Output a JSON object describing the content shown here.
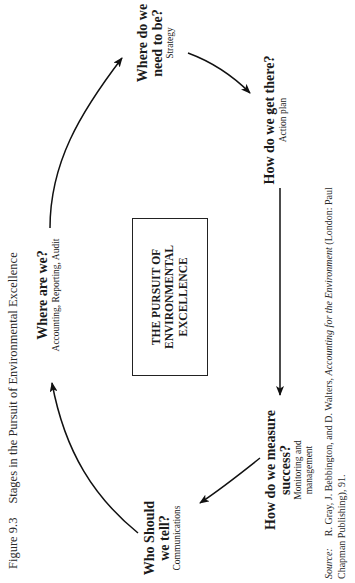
{
  "figure": {
    "number": "Figure 9.3",
    "title": "Stages in the Pursuit of Environmental Excellence"
  },
  "center": {
    "lines": [
      "THE PURSUIT OF",
      "ENVIRONMENTAL",
      "EXCELLENCE"
    ]
  },
  "nodes": [
    {
      "id": "where-are-we",
      "question": "Where are we?",
      "subtitle": "Accounting, Reporting, Audit"
    },
    {
      "id": "where-need-to-be",
      "question_lines": [
        "Where do we",
        "need to be?"
      ],
      "subtitle": "Strategy"
    },
    {
      "id": "how-get-there",
      "question": "How do we get there?",
      "subtitle": "Action plan"
    },
    {
      "id": "how-measure",
      "question_lines": [
        "How do we measure",
        "success?"
      ],
      "subtitle_lines": [
        "Monitoring and",
        "management"
      ]
    },
    {
      "id": "who-tell",
      "question_lines": [
        "Who Should",
        "we tell?"
      ],
      "subtitle": "Communications"
    }
  ],
  "flow": [
    "Where are we?",
    "Where do we need to be?",
    "How do we get there?",
    "How do we measure success?",
    "Who Should we tell?",
    "Where are we?"
  ],
  "source": {
    "label": "Source:",
    "pre": "R. Gray, J. Bebbington, and D. Walters, ",
    "book": "Accounting for the Environment",
    "post": " (London: Paul Chapman Publishing), 91."
  }
}
